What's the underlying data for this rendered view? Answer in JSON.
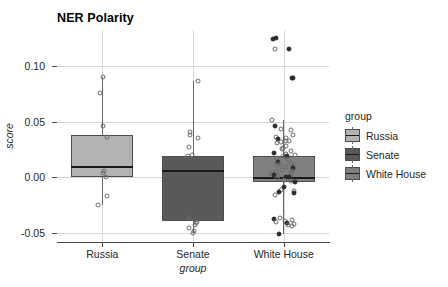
{
  "chart_data": {
    "type": "box",
    "title": "NER Polarity",
    "xlabel": "group",
    "ylabel": "score",
    "categories": [
      "Russia",
      "Senate",
      "White House"
    ],
    "ylim": [
      -0.058,
      0.132
    ],
    "yticks": [
      0.1,
      0.05,
      0.0,
      -0.05
    ],
    "ytick_labels": [
      "0.10",
      "0.05",
      "0.00",
      "-0.05"
    ],
    "grid": "horizontal-and-vertical",
    "legend": {
      "title": "group",
      "position": "right",
      "entries": [
        {
          "label": "Russia",
          "color": "#b3b3b3"
        },
        {
          "label": "Senate",
          "color": "#595959"
        },
        {
          "label": "White House",
          "color": "#808080"
        }
      ]
    },
    "boxes": [
      {
        "category": "Russia",
        "color": "#b3b3b3",
        "whisker_low": -0.025,
        "q1": 0.0,
        "median": 0.009,
        "q3": 0.038,
        "whisker_high": 0.09,
        "points": [
          0.09,
          0.076,
          0.046,
          0.036,
          0.006,
          0.004,
          0.0,
          -0.017,
          -0.025
        ]
      },
      {
        "category": "Senate",
        "color": "#595959",
        "whisker_low": -0.05,
        "q1": -0.039,
        "median": 0.006,
        "q3": 0.019,
        "whisker_high": 0.086,
        "points": [
          0.086,
          0.041,
          0.038,
          0.035,
          0.027,
          0.02,
          0.019,
          -0.036,
          -0.038,
          -0.04,
          -0.041,
          -0.043,
          -0.045,
          -0.048,
          -0.05
        ]
      },
      {
        "category": "White House",
        "color": "#808080",
        "whisker_low": -0.051,
        "q1": -0.004,
        "median": -0.001,
        "q3": 0.019,
        "whisker_high": 0.051,
        "points": [
          0.125,
          0.124,
          0.115,
          0.115,
          0.089,
          0.089,
          0.051,
          0.046,
          0.043,
          0.042,
          0.038,
          0.036,
          0.035,
          0.034,
          0.033,
          0.033,
          0.032,
          0.031,
          0.028,
          0.026,
          0.025,
          0.024,
          0.022,
          0.021,
          0.02,
          0.019,
          0.019,
          0.017,
          0.016,
          0.014,
          0.013,
          0.012,
          0.011,
          0.01,
          0.009,
          0.008,
          0.007,
          0.006,
          0.005,
          0.004,
          0.003,
          0.002,
          0.001,
          0.0,
          0.0,
          -0.001,
          -0.002,
          -0.003,
          -0.004,
          -0.009,
          -0.011,
          -0.012,
          -0.013,
          -0.014,
          -0.016,
          -0.036,
          -0.037,
          -0.038,
          -0.039,
          -0.04,
          -0.041,
          -0.042,
          -0.043,
          -0.044,
          -0.051
        ]
      }
    ]
  }
}
